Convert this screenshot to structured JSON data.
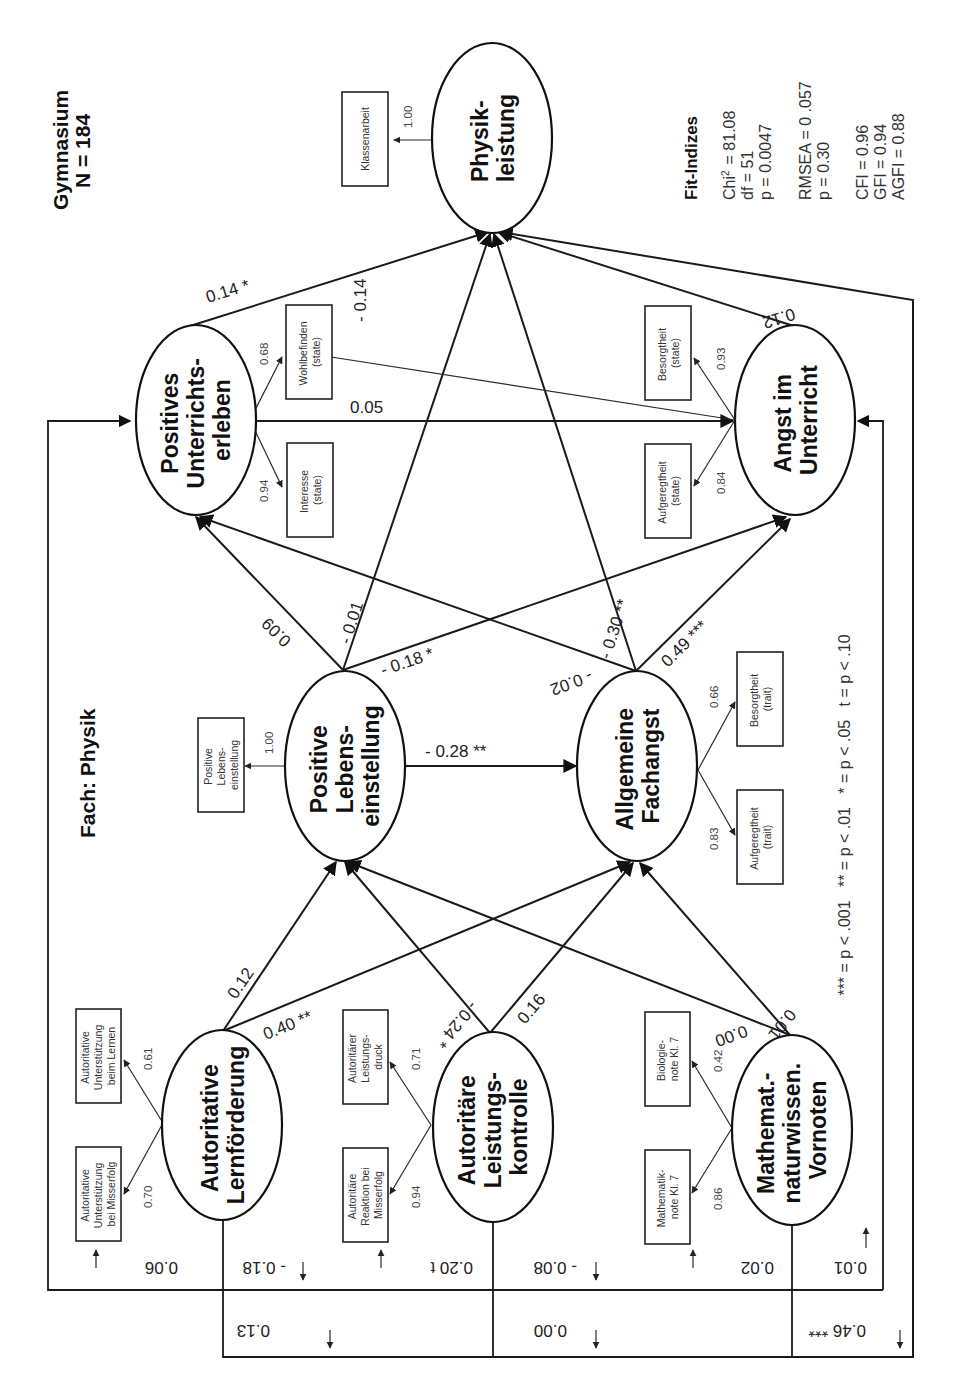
{
  "header": {
    "school": "Gymnasium",
    "sample": "N = 184",
    "subject": "Fach: Physik"
  },
  "fit_indices": {
    "title": "Fit-Indizes",
    "chi2_label": "Chi",
    "chi2_sup": "2",
    "chi2_value": "= 81.08",
    "df": "df = 51",
    "p": "p = 0.0047",
    "rmsea": "RMSEA = 0 .057",
    "rmsea_p": "p = 0.30",
    "cfi": "CFI = 0.96",
    "gfi": "GFI = 0.94",
    "agfi": "AGFI = 0.88"
  },
  "significance_legend": "*** = p < .001   ** = p < .01   * = p < .05   t = p < .10",
  "latent": {
    "physikleistung": [
      "Physik-",
      "leistung"
    ],
    "pos_unterricht": [
      "Positives",
      "Unterrichts-",
      "erleben"
    ],
    "angst_unterricht": [
      "Angst im",
      "Unterricht"
    ],
    "pos_lebens": [
      "Positive",
      "Lebens-",
      "einstellung"
    ],
    "fachangst": [
      "Allgemeine",
      "Fachangst"
    ],
    "autoritative": [
      "Autoritative",
      "Lernförderung"
    ],
    "autoritaere": [
      "Autoritäre",
      "Leistungs-",
      "kontrolle"
    ],
    "vornoten": [
      "Mathemat.-",
      "naturwissen.",
      "Vornoten"
    ]
  },
  "manifest": {
    "klassenarbeit": [
      "Klassenarbeit"
    ],
    "wohlbefinden": [
      "Wohlbefinden",
      "(state)"
    ],
    "interesse": [
      "Interesse",
      "(state)"
    ],
    "besorgtheit_state": [
      "Besorgtheit",
      "(state)"
    ],
    "aufgeregtheit_state": [
      "Aufgeregtheit",
      "(state)"
    ],
    "pos_lebens_box": [
      "Positive",
      "Lebens-",
      "einstellung"
    ],
    "besorgtheit_trait": [
      "Besorgtheit",
      "(trait)"
    ],
    "aufgeregtheit_trait": [
      "Aufgeregtheit",
      "(trait)"
    ],
    "unterst_lernen": [
      "Autoritative",
      "Unterstützung",
      "beim Lernen"
    ],
    "unterst_misserfolg": [
      "Autoritative",
      "Unterstützung",
      "bei Misserfolg"
    ],
    "leistungsdruck": [
      "Autoritärer",
      "Leistungs-",
      "druck"
    ],
    "reaktion_misserfolg": [
      "Autoritäre",
      "Reaktion bei",
      "Misserfolg"
    ],
    "biologienote": [
      "Biologie-",
      "note Kl. 7"
    ],
    "mathenote": [
      "Mathematik-",
      "note Kl. 7"
    ]
  },
  "loadings": {
    "klassenarbeit": "1.00",
    "wohlbefinden": "0.68",
    "interesse": "0.94",
    "besorgtheit_state": "0.93",
    "aufgeregtheit_state": "0.84",
    "pos_lebens_box": "1.00",
    "besorgtheit_trait": "0.66",
    "aufgeregtheit_trait": "0.83",
    "unterst_lernen": "0.61",
    "unterst_misserfolg": "0.70",
    "leistungsdruck": "0.71",
    "reaktion_misserfolg": "0.94",
    "biologienote": "0.42",
    "mathenote": "0.86"
  },
  "paths": {
    "pos_unterricht_to_physik": "0.14 *",
    "angst_to_physik": "0.12",
    "pos_unterricht_to_angst": "0.05",
    "angst_state_corr": "- 0.14",
    "pos_lebens_to_pos_unterricht": "0.09",
    "pos_lebens_to_physik": "- 0.01",
    "pos_lebens_to_angst": "- 0.18 *",
    "pos_lebens_to_fachangst": "- 0.28 **",
    "fachangst_to_pos_unterricht": "- 0.02",
    "fachangst_to_physik": "- 0.30 **",
    "fachangst_to_angst": "0.49 ***",
    "autoritative_to_pos_lebens": "0.12",
    "autoritative_to_fachangst": "0.40 **",
    "autoritaere_to_pos_lebens": "- 0.24 *",
    "autoritaere_to_fachangst": "0.16",
    "vornoten_to_pos_lebens": "0.00",
    "vornoten_to_fachangst": "0.01"
  },
  "direct_paths": {
    "autoritative_to_pos_unterricht": "0.06",
    "autoritative_to_angst": "0.13",
    "autoritaere_to_pos_unterricht": "- 0.18",
    "autoritaere_to_angst_t": "0.20 t",
    "autoritaere_to_angst": "0.00",
    "vornoten_to_pos_unterricht": "- 0.08",
    "vornoten_to_angst": "0.02",
    "vornoten_to_physik_a": "0.01",
    "vornoten_to_physik_b": "0.46 ***"
  }
}
